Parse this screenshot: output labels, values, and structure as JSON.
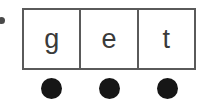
{
  "worksheet": {
    "word": "get",
    "margin_marker": "bullet-dot",
    "marker_color": "#4a4a4a",
    "background_color": "#ffffff",
    "grid": {
      "border_color": "#5a5a5a",
      "cell_fill": "#ffffff",
      "cells": [
        {
          "letter": "g"
        },
        {
          "letter": "e"
        },
        {
          "letter": "t"
        }
      ]
    },
    "counters": {
      "color": "#161616",
      "count": 3,
      "items": [
        {
          "label": "counter-1"
        },
        {
          "label": "counter-2"
        },
        {
          "label": "counter-3"
        }
      ]
    }
  }
}
